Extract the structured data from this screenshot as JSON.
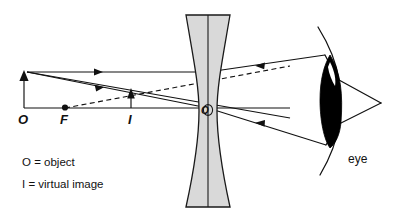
{
  "diagram": {
    "type": "optics-ray-diagram",
    "background_color": "#ffffff",
    "line_color": "#111111",
    "lens_fill_color": "#d9d9d9",
    "eye_lens_color": "#000000"
  },
  "labels": {
    "object_point": "O",
    "focal_point": "F",
    "image_point": "I",
    "lens_center": "O",
    "eye": "eye"
  },
  "legend": {
    "rows": [
      {
        "symbol": "O",
        "equals": "=",
        "meaning": "object"
      },
      {
        "symbol": "I",
        "equals": "=",
        "meaning": "virtual image"
      }
    ],
    "line1_full": "O = object",
    "line2_full": "I = virtual image"
  },
  "optical_elements": {
    "lens": {
      "kind": "biconcave-diverging",
      "center_x": 208,
      "top_y": 15,
      "bottom_y": 207,
      "edge_half_width": 22,
      "center_half_width": 9
    },
    "principal_axis": {
      "y": 108,
      "x_start": 24,
      "x_end": 290
    },
    "object_arrow": {
      "x": 24,
      "base_y": 108,
      "tip_y": 72,
      "direction": "up"
    },
    "image_arrow": {
      "x": 131,
      "base_y": 108,
      "tip_y": 91,
      "direction": "up"
    },
    "focal_point": {
      "x": 65,
      "y": 108
    },
    "eye": {
      "lens_center_x": 330,
      "lens_center_y": 101,
      "apex_x": 381,
      "apex_y": 103
    }
  },
  "rays": [
    {
      "id": "ray-1-parallel",
      "style": "solid",
      "description": "Parallel ray from object top to lens, refracted to diverge toward eye",
      "arrow_direction": "right"
    },
    {
      "id": "ray-2-through-center",
      "style": "solid",
      "description": "Ray from object top through lens optical centre toward eye",
      "arrow_direction": "right"
    },
    {
      "id": "ray-3-virtual-extension",
      "style": "dashed",
      "description": "Backward virtual extension of refracted ray converging at image point I",
      "arrow_direction": "none"
    }
  ]
}
